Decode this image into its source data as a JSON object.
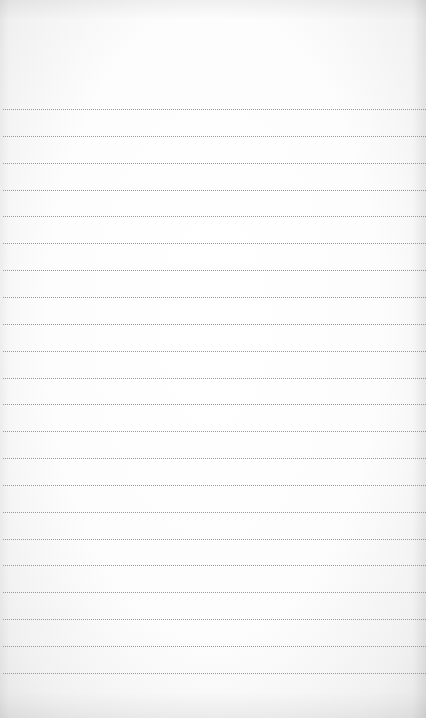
{
  "page": {
    "type": "lined-notepad",
    "paper_color": "#fdfdfd",
    "rule_color": "#9a9a9a",
    "rule_style": "dotted",
    "rule_count": 22,
    "first_rule_y": 109,
    "rule_spacing": 26.85,
    "content": ""
  }
}
